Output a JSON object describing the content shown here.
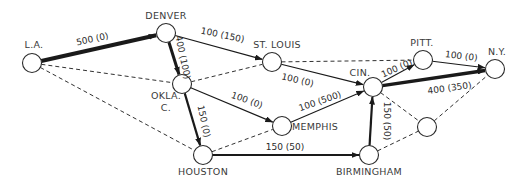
{
  "diagram": {
    "nodes": [
      {
        "id": "la",
        "label": "L.A.",
        "x": 32,
        "y": 63,
        "lx": 34,
        "ly": 48,
        "anchor": "middle"
      },
      {
        "id": "denver",
        "label": "DENVER",
        "x": 166,
        "y": 33,
        "lx": 166,
        "ly": 19,
        "anchor": "middle"
      },
      {
        "id": "okla",
        "label": "OKLA.",
        "label2": "C.",
        "x": 182,
        "y": 84,
        "lx": 166,
        "ly": 99,
        "anchor": "middle"
      },
      {
        "id": "stlouis",
        "label": "ST. LOUIS",
        "x": 272,
        "y": 62,
        "lx": 277,
        "ly": 48,
        "anchor": "middle"
      },
      {
        "id": "cin",
        "label": "CIN.",
        "x": 373,
        "y": 87,
        "lx": 360,
        "ly": 76,
        "anchor": "middle"
      },
      {
        "id": "pitt",
        "label": "PITT.",
        "x": 423,
        "y": 60,
        "lx": 422,
        "ly": 46,
        "anchor": "middle"
      },
      {
        "id": "ny",
        "label": "N.Y.",
        "x": 495,
        "y": 69,
        "lx": 497,
        "ly": 55,
        "anchor": "middle"
      },
      {
        "id": "memphis",
        "label": "MEMPHIS",
        "x": 282,
        "y": 126,
        "lx": 292,
        "ly": 130,
        "anchor": "start"
      },
      {
        "id": "houston",
        "label": "HOUSTON",
        "x": 203,
        "y": 155,
        "lx": 203,
        "ly": 175,
        "anchor": "middle"
      },
      {
        "id": "birmingham",
        "label": "BIRMINGHAM",
        "x": 369,
        "y": 155,
        "lx": 369,
        "ly": 175,
        "anchor": "middle"
      },
      {
        "id": "unlabeled",
        "label": "",
        "x": 427,
        "y": 127,
        "lx": 427,
        "ly": 127,
        "anchor": "middle"
      }
    ],
    "edges": [
      {
        "from": "la",
        "to": "denver",
        "label": "500 (0)",
        "style": "solid",
        "width": 4,
        "arrow": true,
        "lx": 93,
        "ly": 42,
        "rot": -12
      },
      {
        "from": "la",
        "to": "okla",
        "label": "",
        "style": "dashed",
        "width": 0.9,
        "arrow": false
      },
      {
        "from": "la",
        "to": "houston",
        "label": "",
        "style": "dashed",
        "width": 0.9,
        "arrow": false
      },
      {
        "from": "denver",
        "to": "stlouis",
        "label": "100 (150)",
        "style": "solid",
        "width": 1.1,
        "arrow": true,
        "lx": 222,
        "ly": 38,
        "rot": 12
      },
      {
        "from": "denver",
        "to": "okla",
        "label": "400 (100)",
        "style": "solid",
        "width": 3,
        "arrow": true,
        "lx": 180,
        "ly": 58,
        "rot": 78
      },
      {
        "from": "okla",
        "to": "stlouis",
        "label": "",
        "style": "dashed",
        "width": 0.9,
        "arrow": false
      },
      {
        "from": "okla",
        "to": "memphis",
        "label": "100 (0)",
        "style": "solid",
        "width": 1.1,
        "arrow": true,
        "lx": 246,
        "ly": 103,
        "rot": 20
      },
      {
        "from": "okla",
        "to": "houston",
        "label": "150 (0)",
        "style": "solid",
        "width": 2.2,
        "arrow": true,
        "lx": 201,
        "ly": 122,
        "rot": 78
      },
      {
        "from": "stlouis",
        "to": "cin",
        "label": "100 (0)",
        "style": "solid",
        "width": 1.1,
        "arrow": true,
        "lx": 297,
        "ly": 83,
        "rot": 13
      },
      {
        "from": "stlouis",
        "to": "pitt",
        "label": "",
        "style": "dashed",
        "width": 0.9,
        "arrow": false
      },
      {
        "from": "memphis",
        "to": "cin",
        "label": "100 (500)",
        "style": "solid",
        "width": 1.1,
        "arrow": true,
        "lx": 321,
        "ly": 104,
        "rot": -19
      },
      {
        "from": "houston",
        "to": "memphis",
        "label": "",
        "style": "dashed",
        "width": 0.9,
        "arrow": false
      },
      {
        "from": "houston",
        "to": "birmingham",
        "label": "150 (50)",
        "style": "solid",
        "width": 2.2,
        "arrow": true,
        "lx": 285,
        "ly": 150,
        "rot": 0
      },
      {
        "from": "birmingham",
        "to": "cin",
        "label": "150 (50)",
        "style": "solid",
        "width": 2.2,
        "arrow": true,
        "lx": 384,
        "ly": 121,
        "rot": 90
      },
      {
        "from": "birmingham",
        "to": "unlabeled",
        "label": "",
        "style": "dashed",
        "width": 0.9,
        "arrow": false
      },
      {
        "from": "cin",
        "to": "unlabeled",
        "label": "",
        "style": "dashed",
        "width": 0.9,
        "arrow": false
      },
      {
        "from": "unlabeled",
        "to": "ny",
        "label": "",
        "style": "dashed",
        "width": 0.9,
        "arrow": false
      },
      {
        "from": "cin",
        "to": "pitt",
        "label": "100 (0)",
        "style": "solid",
        "width": 1.1,
        "arrow": true,
        "lx": 398,
        "ly": 71,
        "rot": -24
      },
      {
        "from": "cin",
        "to": "ny",
        "label": "400 (350)",
        "style": "solid",
        "width": 3.5,
        "arrow": true,
        "lx": 450,
        "ly": 91,
        "rot": -8
      },
      {
        "from": "pitt",
        "to": "ny",
        "label": "100 (0)",
        "style": "solid",
        "width": 1.1,
        "arrow": true,
        "lx": 461,
        "ly": 59,
        "rot": 7
      }
    ]
  }
}
